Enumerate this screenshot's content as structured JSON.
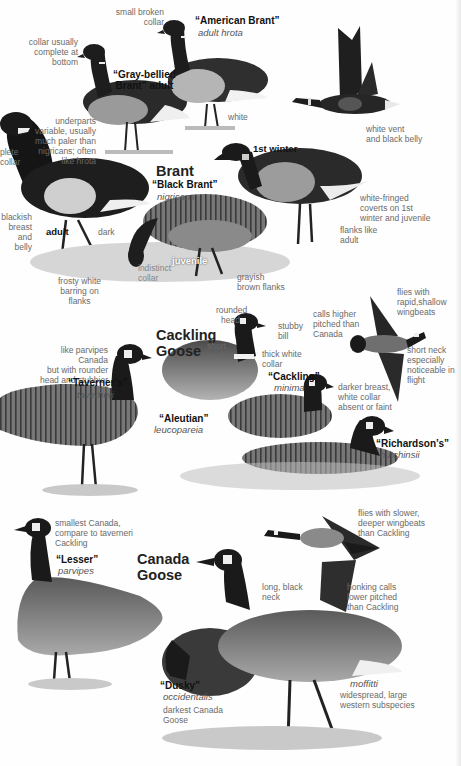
{
  "species": {
    "brant": {
      "title": "Brant",
      "forms": {
        "gray_bellied": {
          "name_line1": "“Gray-bellied",
          "name_line2": "Brant” adult"
        },
        "american": {
          "name": "“American Brant”",
          "sci": "adult hrota"
        },
        "black": {
          "name": "“Black Brant”",
          "sci": "nigricans"
        }
      },
      "ages": {
        "adult": "adult",
        "first_winter": "1st winter",
        "juvenile": "juvenile"
      },
      "labels": {
        "small_broken_collar": [
          "small broken",
          "collar"
        ],
        "collar_usually": [
          "collar usually",
          "complete at",
          "bottom"
        ],
        "underparts": [
          "underparts",
          "variable, usually",
          "much paler than",
          "nigricans; often",
          "like hrota"
        ],
        "complete_collar": [
          "plete",
          "collar"
        ],
        "blackish": [
          "blackish",
          "breast and",
          "belly"
        ],
        "dark": "dark",
        "white": "white",
        "white_vent": [
          "white vent",
          "and black belly"
        ],
        "frosty": [
          "frosty white",
          "barring on",
          "flanks"
        ],
        "white_fringed": [
          "white-fringed",
          "coverts on 1st",
          "winter and juvenile"
        ],
        "flanks_like_adult": [
          "flanks like",
          "adult"
        ],
        "juv_collar": [
          "indistinct",
          "collar"
        ],
        "brown_flanks": [
          "grayish",
          "brown flanks"
        ]
      }
    },
    "cackling": {
      "title_line1": "Cackling",
      "title_line2": "Goose",
      "forms": {
        "taverner": {
          "name": "“Taverner’s”",
          "sci": "taverneri"
        },
        "cackling": {
          "name": "“Cackling”",
          "sci": "minima"
        },
        "aleutian": {
          "name": "“Aleutian”",
          "sci": "leucopareia"
        },
        "richardson": {
          "name": "“Richardson’s”",
          "sci": "hutchinsii"
        }
      },
      "labels": {
        "like_parvipes": [
          "like parvipes Canada",
          "but with rounder",
          "head and stubbier bill"
        ],
        "rounded_head": [
          "rounded",
          "head"
        ],
        "short_neck": [
          "short",
          "neck"
        ],
        "stubby_bill": [
          "stubby",
          "bill"
        ],
        "thick_white_collar": [
          "thick white",
          "collar"
        ],
        "calls_higher": [
          "calls higher",
          "pitched than",
          "Canada"
        ],
        "flies_rapid": [
          "flies with",
          "rapid,shallow",
          "wingbeats"
        ],
        "short_neck_flight": [
          "short neck",
          "especially",
          "noticeable in",
          "flight"
        ],
        "darker_breast": [
          "darker breast,",
          "white collar",
          "absent or faint"
        ]
      }
    },
    "canada": {
      "title_line1": "Canada",
      "title_line2": "Goose",
      "forms": {
        "lesser": {
          "name": "“Lesser”",
          "sci": "parvipes"
        },
        "dusky": {
          "name": "“Dusky”",
          "sci": "occidentalis"
        },
        "moffitti": {
          "sci": "moffitti"
        }
      },
      "labels": {
        "smallest": [
          "smallest Canada,",
          "compare to taverneri",
          "Cackling"
        ],
        "long_black_neck": [
          "long, black",
          "neck"
        ],
        "flies_slower": [
          "flies with slower,",
          "deeper wingbeats",
          "than Cackling"
        ],
        "honking": [
          "honking calls",
          "lower pitched",
          "than Cackling"
        ],
        "darkest": [
          "darkest Canada",
          "Goose"
        ],
        "widespread": [
          "widespread, large",
          "western subspecies"
        ]
      }
    }
  },
  "colors": {
    "ink": "#111111",
    "label_gray": "#6a6a6a",
    "bird_dark": "#1c1c1c",
    "bird_mid": "#6e6e6e",
    "bird_light": "#bdbdbd",
    "grass": "#8a8a8a"
  }
}
